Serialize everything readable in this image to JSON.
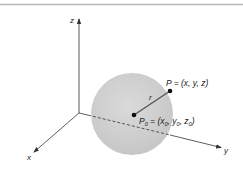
{
  "figure": {
    "axes": {
      "x_label": "x",
      "y_label": "y",
      "z_label": "z"
    },
    "sphere": {
      "radius_label": "r",
      "center_point": {
        "name": "P",
        "sub": "0",
        "eq": " = (x",
        "x_sub": "0",
        "sep1": ", y",
        "y_sub": "0",
        "sep2": ", z",
        "z_sub": "0",
        "close": ")"
      },
      "surface_point": {
        "label": "P = (x, y, z)"
      }
    },
    "colors": {
      "border_line": "#b8b8b8",
      "axis": "#333333",
      "sphere_fill": "#cfcfcf",
      "sphere_edge": "#d9d9d9",
      "point": "#111111"
    }
  }
}
